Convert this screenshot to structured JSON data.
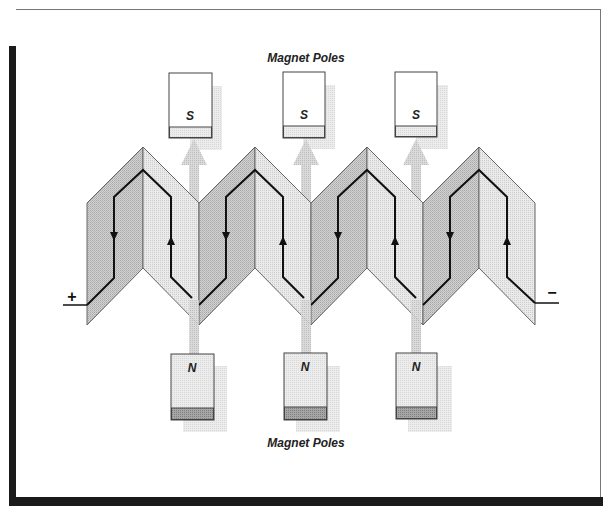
{
  "diagram": {
    "top_label": "Magnet Poles",
    "bottom_label": "Magnet Poles",
    "positive_terminal": "+",
    "negative_terminal": "−",
    "south_magnets": [
      {
        "label": "S",
        "x": 169,
        "y": 73
      },
      {
        "label": "S",
        "x": 283,
        "y": 72
      },
      {
        "label": "S",
        "x": 395,
        "y": 72
      }
    ],
    "north_magnets": [
      {
        "label": "N",
        "x": 171,
        "y": 354
      },
      {
        "label": "N",
        "x": 284,
        "y": 354
      },
      {
        "label": "N",
        "x": 396,
        "y": 354
      }
    ],
    "coil_modules": 4,
    "current_direction": {
      "left_segment": "down",
      "right_segment": "up"
    },
    "flux_direction": "up (N to S)",
    "colors": {
      "outline": "#555555",
      "wire": "#111111",
      "panel_left": "#c4c4c4",
      "panel_right": "#e0e0e0",
      "flux_arrow": "#cfcfcf",
      "magnet_shadow": "#e3e3e3",
      "north_strip": "#9a9a9a",
      "frame_shadow": "#1a1a1a"
    }
  }
}
